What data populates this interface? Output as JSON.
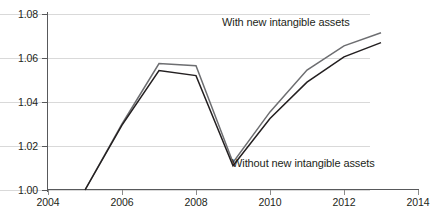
{
  "chart_data": {
    "type": "line",
    "title": "",
    "xlabel": "",
    "ylabel": "",
    "xlim": [
      2004,
      2014
    ],
    "ylim": [
      1.0,
      1.08
    ],
    "grid": true,
    "legend_position": "in-plot annotations",
    "x": [
      2005,
      2006,
      2007,
      2008,
      2009,
      2010,
      2011,
      2012,
      2013
    ],
    "xticks": [
      "2004",
      "2006",
      "2008",
      "2010",
      "2012",
      "2014"
    ],
    "yticks": [
      "1.00",
      "1.02",
      "1.04",
      "1.06",
      "1.08"
    ],
    "series": [
      {
        "name": "With new intangible assets",
        "color": "#6d6e71",
        "values": [
          1.0,
          1.03,
          1.0575,
          1.0565,
          1.0125,
          1.0355,
          1.0545,
          1.0655,
          1.0715
        ]
      },
      {
        "name": "Without new intangible assets",
        "color": "#231f20",
        "values": [
          1.0,
          1.0295,
          1.0543,
          1.052,
          1.011,
          1.0325,
          1.049,
          1.0605,
          1.067
        ]
      }
    ],
    "annotations": [
      {
        "text": "With new intangible assets",
        "series": "With new intangible assets"
      },
      {
        "text": "Without new intangible assets",
        "series": "Without new intangible assets"
      }
    ]
  },
  "axes": {
    "y_tick_labels": [
      "1.08",
      "1.06",
      "1.04",
      "1.02",
      "1.00"
    ],
    "x_tick_labels": [
      "2004",
      "2006",
      "2008",
      "2010",
      "2012",
      "2014"
    ]
  },
  "colors": {
    "line_with": "#6d6e71",
    "line_without": "#231f20",
    "gridline": "#d9d9d9",
    "axis": "#58595b",
    "text": "#231f20",
    "background": "#ffffff"
  }
}
